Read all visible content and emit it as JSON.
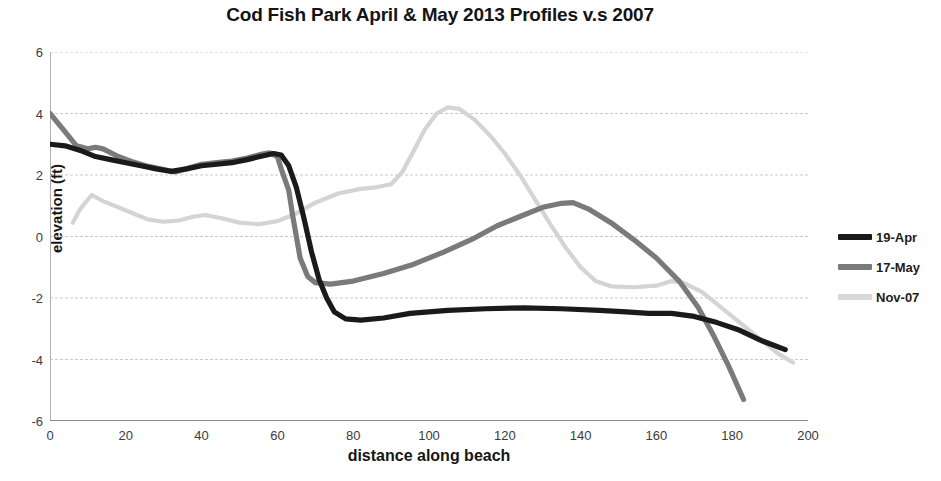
{
  "chart_data": {
    "type": "line",
    "title": "Cod Fish Park April & May 2013 Profiles v.s 2007",
    "xlabel": "distance along beach",
    "ylabel": "elevation (ft)",
    "xlim": [
      0,
      200
    ],
    "ylim": [
      -6,
      6
    ],
    "xticks": [
      0,
      20,
      40,
      60,
      80,
      100,
      120,
      140,
      160,
      180,
      200
    ],
    "yticks": [
      -6,
      -4,
      -2,
      0,
      2,
      4,
      6
    ],
    "grid": "horizontal",
    "legend_position": "right",
    "series": [
      {
        "name": "19-Apr",
        "color": "#1a1a1a",
        "points": [
          [
            0,
            3.0
          ],
          [
            4,
            2.95
          ],
          [
            8,
            2.8
          ],
          [
            12,
            2.6
          ],
          [
            16,
            2.5
          ],
          [
            20,
            2.4
          ],
          [
            24,
            2.3
          ],
          [
            28,
            2.2
          ],
          [
            32,
            2.12
          ],
          [
            36,
            2.2
          ],
          [
            40,
            2.3
          ],
          [
            44,
            2.35
          ],
          [
            48,
            2.4
          ],
          [
            52,
            2.5
          ],
          [
            56,
            2.62
          ],
          [
            59,
            2.7
          ],
          [
            61,
            2.65
          ],
          [
            63,
            2.3
          ],
          [
            65,
            1.6
          ],
          [
            67,
            0.6
          ],
          [
            69,
            -0.5
          ],
          [
            71,
            -1.4
          ],
          [
            73,
            -2.0
          ],
          [
            75,
            -2.45
          ],
          [
            78,
            -2.68
          ],
          [
            82,
            -2.72
          ],
          [
            88,
            -2.65
          ],
          [
            95,
            -2.5
          ],
          [
            105,
            -2.4
          ],
          [
            115,
            -2.35
          ],
          [
            125,
            -2.32
          ],
          [
            135,
            -2.35
          ],
          [
            145,
            -2.4
          ],
          [
            152,
            -2.45
          ],
          [
            158,
            -2.5
          ],
          [
            164,
            -2.5
          ],
          [
            170,
            -2.6
          ],
          [
            176,
            -2.8
          ],
          [
            182,
            -3.05
          ],
          [
            188,
            -3.4
          ],
          [
            194,
            -3.68
          ]
        ]
      },
      {
        "name": "17-May",
        "color": "#7a7a7a",
        "points": [
          [
            0,
            4.0
          ],
          [
            4,
            3.4
          ],
          [
            7,
            2.95
          ],
          [
            10,
            2.85
          ],
          [
            12,
            2.9
          ],
          [
            14,
            2.85
          ],
          [
            18,
            2.6
          ],
          [
            22,
            2.42
          ],
          [
            26,
            2.28
          ],
          [
            30,
            2.18
          ],
          [
            33,
            2.1
          ],
          [
            36,
            2.2
          ],
          [
            40,
            2.35
          ],
          [
            44,
            2.4
          ],
          [
            48,
            2.45
          ],
          [
            52,
            2.55
          ],
          [
            56,
            2.68
          ],
          [
            58,
            2.72
          ],
          [
            60,
            2.6
          ],
          [
            61,
            2.2
          ],
          [
            63,
            1.5
          ],
          [
            64,
            0.7
          ],
          [
            65,
            0.0
          ],
          [
            66,
            -0.7
          ],
          [
            68,
            -1.3
          ],
          [
            70,
            -1.5
          ],
          [
            74,
            -1.55
          ],
          [
            80,
            -1.45
          ],
          [
            88,
            -1.2
          ],
          [
            96,
            -0.9
          ],
          [
            104,
            -0.5
          ],
          [
            112,
            -0.05
          ],
          [
            118,
            0.35
          ],
          [
            124,
            0.65
          ],
          [
            130,
            0.95
          ],
          [
            135,
            1.08
          ],
          [
            138,
            1.1
          ],
          [
            142,
            0.9
          ],
          [
            148,
            0.45
          ],
          [
            154,
            -0.1
          ],
          [
            160,
            -0.7
          ],
          [
            166,
            -1.45
          ],
          [
            171,
            -2.3
          ],
          [
            175,
            -3.2
          ],
          [
            179,
            -4.2
          ],
          [
            183,
            -5.3
          ]
        ]
      },
      {
        "name": "Nov-07",
        "color": "#d4d4d4",
        "points": [
          [
            6,
            0.45
          ],
          [
            8,
            0.9
          ],
          [
            11,
            1.35
          ],
          [
            14,
            1.15
          ],
          [
            18,
            0.95
          ],
          [
            22,
            0.75
          ],
          [
            26,
            0.55
          ],
          [
            30,
            0.48
          ],
          [
            34,
            0.52
          ],
          [
            38,
            0.65
          ],
          [
            41,
            0.7
          ],
          [
            45,
            0.6
          ],
          [
            50,
            0.45
          ],
          [
            55,
            0.4
          ],
          [
            60,
            0.5
          ],
          [
            65,
            0.75
          ],
          [
            70,
            1.1
          ],
          [
            76,
            1.4
          ],
          [
            82,
            1.55
          ],
          [
            86,
            1.6
          ],
          [
            90,
            1.7
          ],
          [
            93,
            2.1
          ],
          [
            96,
            2.8
          ],
          [
            99,
            3.5
          ],
          [
            102,
            4.0
          ],
          [
            105,
            4.2
          ],
          [
            108,
            4.15
          ],
          [
            112,
            3.8
          ],
          [
            116,
            3.3
          ],
          [
            120,
            2.7
          ],
          [
            124,
            2.0
          ],
          [
            128,
            1.2
          ],
          [
            132,
            0.4
          ],
          [
            136,
            -0.35
          ],
          [
            140,
            -1.0
          ],
          [
            144,
            -1.45
          ],
          [
            148,
            -1.62
          ],
          [
            154,
            -1.65
          ],
          [
            160,
            -1.6
          ],
          [
            164,
            -1.45
          ],
          [
            167,
            -1.5
          ],
          [
            172,
            -1.8
          ],
          [
            176,
            -2.2
          ],
          [
            180,
            -2.6
          ],
          [
            184,
            -3.0
          ],
          [
            188,
            -3.4
          ],
          [
            192,
            -3.8
          ],
          [
            196,
            -4.1
          ]
        ]
      }
    ]
  },
  "legend": {
    "items": [
      {
        "label": "19-Apr",
        "color": "#1a1a1a"
      },
      {
        "label": "17-May",
        "color": "#7a7a7a"
      },
      {
        "label": "Nov-07",
        "color": "#d8d8d8"
      }
    ]
  }
}
